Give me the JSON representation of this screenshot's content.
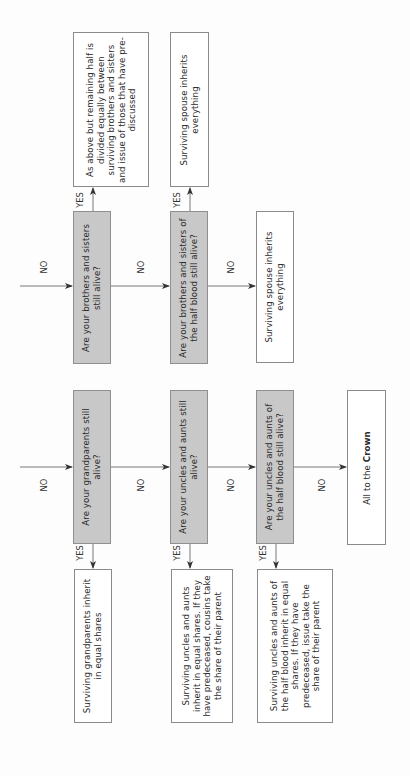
{
  "diagram": {
    "title": "",
    "orientation": "rotated-90-ccw",
    "labels": {
      "yes": "YES",
      "no": "NO"
    },
    "row1": {
      "questions": [
        {
          "id": "q-brothers-sisters",
          "text": "Are your brothers and sisters still alive?"
        },
        {
          "id": "q-half-blood-siblings",
          "text": "Are your brothers and sisters of the half blood still alive?"
        }
      ],
      "yes_outcomes": [
        {
          "id": "o-siblings",
          "text": "As above but remaining half is divided equally between surviving brothers and sisters and issue of those that have pre-discussed"
        },
        {
          "id": "o-spouse-1",
          "text": "Surviving spouse inherits everything"
        }
      ],
      "no_outcome": {
        "id": "o-spouse-2",
        "text": "Surviving spouse inherits everything"
      }
    },
    "row2": {
      "questions": [
        {
          "id": "q-grandparents",
          "text": "Are your grandparents still alive?"
        },
        {
          "id": "q-uncles-aunts",
          "text": "Are your uncles and aunts still alive?"
        },
        {
          "id": "q-half-blood-uncles",
          "text": "Are your uncles and aunts of the half blood still alive?"
        }
      ],
      "yes_outcomes": [
        {
          "id": "o-grandparents",
          "text": "Surviving grandparents inherit in equal shares"
        },
        {
          "id": "o-uncles-aunts",
          "text": "Surviving uncles and aunts inherit in equal shares. If they have predeceased, cousins take the share of their parent"
        },
        {
          "id": "o-half-blood-uncles",
          "text": "Surviving uncles and aunts of the half blood inherit in equal shares. If they have predeceased, issue take the share of their parent"
        }
      ],
      "no_outcome": {
        "id": "o-crown",
        "text_prefix": "All to the ",
        "text_bold": "Crown"
      }
    }
  },
  "colors": {
    "question_fill": "#c8c8c8",
    "outcome_fill": "#ffffff",
    "border": "#8a8a8a",
    "arrow": "#333333"
  }
}
